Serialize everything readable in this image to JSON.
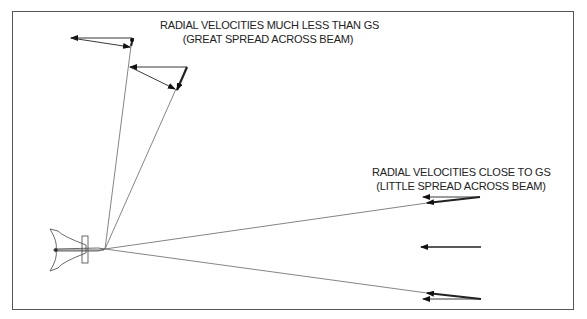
{
  "diagram": {
    "type": "radar-beam-velocity-diagram",
    "captions": {
      "top": {
        "line1": "RADIAL VELOCITIES MUCH LESS THAN GS",
        "line2": "(GREAT SPREAD ACROSS BEAM)"
      },
      "right": {
        "line1": "RADIAL VELOCITIES CLOSE TO GS",
        "line2": "(LITTLE SPREAD ACROSS BEAM)"
      }
    },
    "elements": {
      "aircraft": "aircraft-top-view",
      "beams_near_track": 2,
      "beams_far_abeam": 2,
      "velocity_arrow_groups": 5
    },
    "colors": {
      "line": "#333333",
      "frame": "#555555",
      "background": "#ffffff"
    }
  }
}
